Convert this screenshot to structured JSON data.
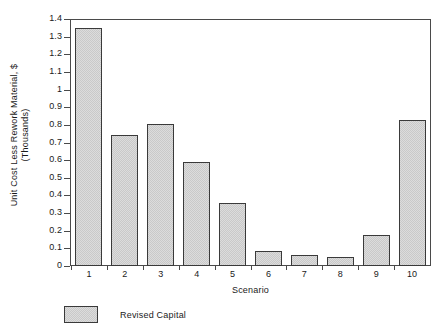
{
  "chart_data": {
    "type": "bar",
    "title": "",
    "xlabel": "Scenario",
    "ylabel": "Unit Cost Less Rework Material, $ (Thousands)",
    "ylabel_line1": "Unit Cost Less Rework Material, $",
    "ylabel_line2": "(Thousands)",
    "categories": [
      "1",
      "2",
      "3",
      "4",
      "5",
      "6",
      "7",
      "8",
      "9",
      "10"
    ],
    "values": [
      1.35,
      0.745,
      0.805,
      0.59,
      0.355,
      0.085,
      0.06,
      0.052,
      0.175,
      0.825
    ],
    "series": [
      {
        "name": "Revised Capital",
        "values": [
          1.35,
          0.745,
          0.805,
          0.59,
          0.355,
          0.085,
          0.06,
          0.052,
          0.175,
          0.825
        ]
      }
    ],
    "ylim": [
      0,
      1.4
    ],
    "yticks": [
      "0",
      "0.1",
      "0.2",
      "0.3",
      "0.4",
      "0.5",
      "0.6",
      "0.7",
      "0.8",
      "0.9",
      "1",
      "1.1",
      "1.2",
      "1.3",
      "1.4"
    ],
    "ytick_values": [
      0,
      0.1,
      0.2,
      0.3,
      0.4,
      0.5,
      0.6,
      0.7,
      0.8,
      0.9,
      1.0,
      1.1,
      1.2,
      1.3,
      1.4
    ],
    "grid": false,
    "legend_position": "bottom-left",
    "legend": [
      {
        "label": "Revised Capital",
        "color": "#dcdcdc"
      }
    ],
    "colors": {
      "bar_fill": "#dcdcdc",
      "bar_edge": "#3a3a3a",
      "axis": "#4a4a4a",
      "text": "#1a1a1a",
      "background": "#ffffff"
    }
  }
}
